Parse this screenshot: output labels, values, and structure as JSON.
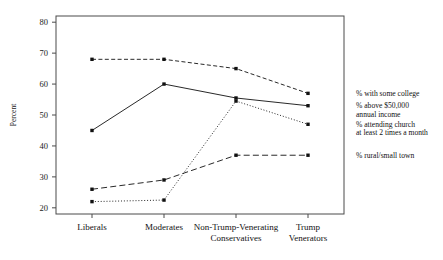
{
  "chart_data": {
    "type": "line",
    "title": "",
    "xlabel": "",
    "ylabel": "Percent",
    "ylim": [
      18,
      82
    ],
    "yticks": [
      20,
      30,
      40,
      50,
      60,
      70,
      80
    ],
    "grid": false,
    "legend_position": "right",
    "categories": [
      "Liberals",
      "Moderates",
      "Non-Trump-Venerating Conservatives",
      "Trump Venerators"
    ],
    "category_lines": [
      [
        "Liberals"
      ],
      [
        "Moderates"
      ],
      [
        "Non-Trump-Venerating",
        "Conservatives"
      ],
      [
        "Trump",
        "Venerators"
      ]
    ],
    "series": [
      {
        "name": "% with some college",
        "label_lines": [
          "% with some college"
        ],
        "style": "dashed",
        "values": [
          68,
          68,
          65,
          57
        ]
      },
      {
        "name": "% above $50,000 annual income",
        "label_lines": [
          "% above $50,000",
          "annual income"
        ],
        "style": "solid",
        "values": [
          45,
          60,
          55.5,
          53
        ]
      },
      {
        "name": "% attending church at least 2 times a month",
        "label_lines": [
          "% attending church",
          "at least 2 times a month"
        ],
        "style": "dotted",
        "values": [
          22,
          22.5,
          54.5,
          47
        ]
      },
      {
        "name": "% rural/small town",
        "label_lines": [
          "% rural/small town"
        ],
        "style": "longdash",
        "values": [
          26,
          29,
          37,
          37
        ]
      }
    ]
  }
}
